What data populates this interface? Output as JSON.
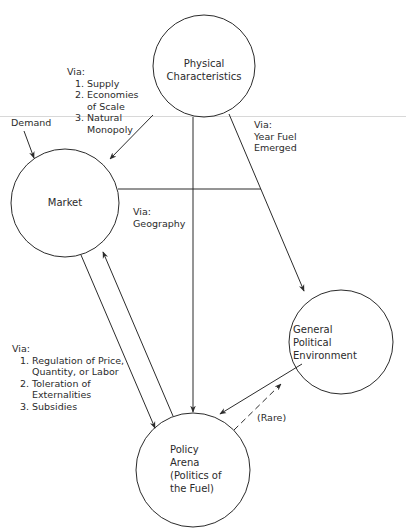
{
  "nodes": {
    "physical": {
      "lines": [
        "Physical",
        "Characteristics"
      ]
    },
    "market": {
      "lines": [
        "Market"
      ]
    },
    "general": {
      "lines": [
        "General",
        "Political",
        "Environment"
      ]
    },
    "policy": {
      "lines": [
        "Policy",
        "Arena",
        "(Politics of",
        "the Fuel)"
      ]
    }
  },
  "labels": {
    "demand": "Demand",
    "physical_to_market": {
      "via": "Via:",
      "items": [
        {
          "num": "1.",
          "text": [
            "Supply"
          ]
        },
        {
          "num": "2.",
          "text": [
            "Economies",
            "of Scale"
          ]
        },
        {
          "num": "3.",
          "text": [
            "Natural",
            "Monopoly"
          ]
        }
      ]
    },
    "physical_to_general": {
      "via": "Via:",
      "lines": [
        "Year Fuel",
        "Emerged"
      ]
    },
    "physical_to_policy": {
      "via": "Via:",
      "lines": [
        "Geography"
      ]
    },
    "market_policy": {
      "via": "Via:",
      "items": [
        {
          "num": "1.",
          "text": [
            "Regulation of Price,",
            "Quantity, or Labor"
          ]
        },
        {
          "num": "2.",
          "text": [
            "Toleration of",
            "Externalities"
          ]
        },
        {
          "num": "3.",
          "text": [
            "Subsidies"
          ]
        }
      ]
    },
    "rare": "(Rare)"
  },
  "colors": {
    "line": "#2b2b2b",
    "background": "#ffffff"
  }
}
